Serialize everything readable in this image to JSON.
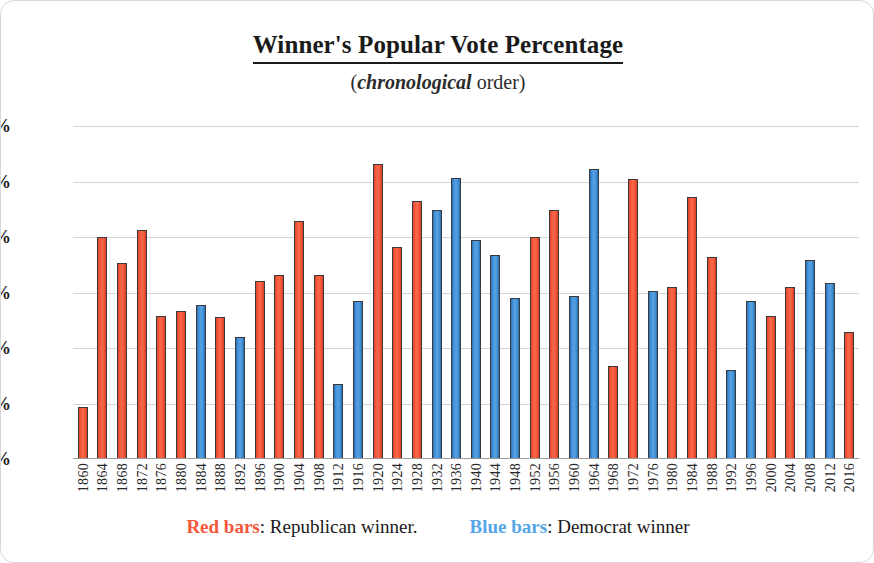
{
  "title": "Winner's Popular Vote Percentage",
  "subtitle_open": "(",
  "subtitle_em": "chronological",
  "subtitle_rest": " order)",
  "legend": {
    "rep_swatch": "Red bars",
    "rep_sep": ":",
    "rep_text": " Republican winner.",
    "dem_swatch": "Blue bars",
    "dem_sep": ":",
    "dem_text": " Democrat winner"
  },
  "colors": {
    "republican": "#f4573a",
    "democrat": "#3e8fd8",
    "gridline": "#d4d4d4",
    "axis": "#9a9a9a",
    "text": "#1a1a1a",
    "frame": "#d8d8d8"
  },
  "chart_data": {
    "type": "bar",
    "title": "Winner's Popular Vote Percentage",
    "subtitle": "(chronological order)",
    "xlabel": "",
    "ylabel": "",
    "ylim": [
      35,
      65
    ],
    "yticks": [
      35,
      40,
      45,
      50,
      55,
      60,
      65
    ],
    "ytick_labels": [
      "35%",
      "40%",
      "45%",
      "50%",
      "55%",
      "60%",
      "65%"
    ],
    "grid": true,
    "legend_position": "bottom",
    "legend_entries": [
      {
        "label": "Red bars: Republican winner.",
        "color": "#f4573a"
      },
      {
        "label": "Blue bars: Democrat winner",
        "color": "#3e8fd8"
      }
    ],
    "categories": [
      "1860",
      "1864",
      "1868",
      "1872",
      "1876",
      "1880",
      "1884",
      "1888",
      "1892",
      "1896",
      "1900",
      "1904",
      "1908",
      "1912",
      "1916",
      "1920",
      "1924",
      "1928",
      "1932",
      "1936",
      "1940",
      "1944",
      "1948",
      "1952",
      "1956",
      "1960",
      "1964",
      "1968",
      "1972",
      "1976",
      "1980",
      "1984",
      "1988",
      "1992",
      "1996",
      "2000",
      "2004",
      "2008",
      "2012",
      "2016"
    ],
    "values": [
      39.7,
      55.0,
      52.7,
      55.6,
      47.9,
      48.3,
      48.9,
      47.8,
      46.0,
      51.0,
      51.6,
      56.4,
      51.6,
      41.8,
      49.2,
      61.6,
      54.1,
      58.2,
      57.4,
      60.3,
      54.7,
      53.4,
      49.5,
      55.0,
      57.4,
      49.7,
      61.1,
      43.4,
      60.2,
      50.1,
      50.5,
      58.6,
      53.2,
      43.0,
      49.2,
      47.9,
      50.5,
      52.9,
      50.9,
      46.4
    ],
    "parties": [
      "Republican",
      "Republican",
      "Republican",
      "Republican",
      "Republican",
      "Republican",
      "Democrat",
      "Republican",
      "Democrat",
      "Republican",
      "Republican",
      "Republican",
      "Republican",
      "Democrat",
      "Democrat",
      "Republican",
      "Republican",
      "Republican",
      "Democrat",
      "Democrat",
      "Democrat",
      "Democrat",
      "Democrat",
      "Republican",
      "Republican",
      "Democrat",
      "Democrat",
      "Republican",
      "Republican",
      "Democrat",
      "Republican",
      "Republican",
      "Republican",
      "Democrat",
      "Democrat",
      "Republican",
      "Republican",
      "Democrat",
      "Democrat",
      "Republican"
    ]
  }
}
